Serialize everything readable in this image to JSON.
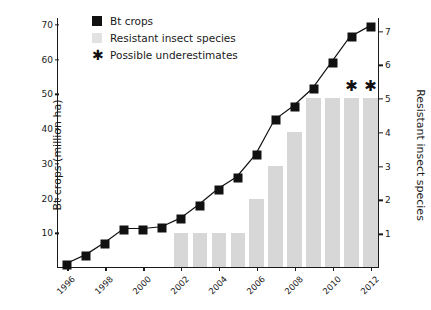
{
  "legend": {
    "position": "top-left-inside",
    "items": [
      {
        "marker": "filled-square-dark",
        "label": "Bt crops"
      },
      {
        "marker": "filled-rect-light",
        "label": "Resistant insect species"
      },
      {
        "marker": "asterisk",
        "label": "Possible underestimates"
      }
    ]
  },
  "chart_data": {
    "type": "bar",
    "title": "",
    "xlabel": "",
    "ylabel": "Bt crops (million ha)",
    "y2label": "Resistant insect species",
    "grid": false,
    "x": [
      1996,
      1997,
      1998,
      1999,
      2000,
      2001,
      2002,
      2003,
      2004,
      2005,
      2006,
      2007,
      2008,
      2009,
      2010,
      2011,
      2012
    ],
    "xlim": [
      1995.5,
      2012.5
    ],
    "xticks": [
      1996,
      1998,
      2000,
      2002,
      2004,
      2006,
      2008,
      2010,
      2012
    ],
    "xtick_labels": [
      "1996",
      "1998",
      "2000",
      "2002",
      "2004",
      "2006",
      "2008",
      "2010",
      "2012"
    ],
    "ylim": [
      0,
      72
    ],
    "yticks": [
      10,
      20,
      30,
      40,
      50,
      60,
      70
    ],
    "ytick_labels": [
      "10",
      "20",
      "30",
      "40",
      "50",
      "60",
      "70"
    ],
    "y2lim": [
      0,
      7.4
    ],
    "y2ticks": [
      1,
      2,
      3,
      4,
      5,
      6,
      7
    ],
    "y2tick_labels": [
      "1",
      "2",
      "3",
      "4",
      "5",
      "6",
      "7"
    ],
    "series": [
      {
        "name": "Bt crops",
        "type": "line",
        "axis": "left",
        "units": "million ha",
        "color": "#111111",
        "marker": "filled-square",
        "values": [
          1,
          3.5,
          7,
          11,
          11,
          11.5,
          14,
          18,
          22.5,
          26,
          32.5,
          42.5,
          46.5,
          51.5,
          59,
          66.5,
          69.5
        ]
      },
      {
        "name": "Resistant insect species",
        "type": "bar",
        "axis": "right",
        "units": "species count",
        "color": "#d7d7d7",
        "values": [
          0,
          0,
          0,
          0,
          0,
          0,
          1,
          1,
          1,
          1,
          2,
          3,
          4,
          5,
          5,
          5,
          5
        ]
      }
    ],
    "annotations": [
      {
        "type": "asterisk",
        "x": 2011,
        "y2": 5,
        "label": "*",
        "meaning": "Possible underestimates"
      },
      {
        "type": "asterisk",
        "x": 2012,
        "y2": 5,
        "label": "*",
        "meaning": "Possible underestimates"
      }
    ]
  }
}
